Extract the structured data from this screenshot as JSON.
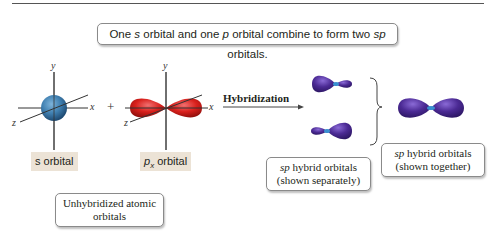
{
  "headline": {
    "prefix": "One ",
    "s": "s",
    "mid1": " orbital and one ",
    "p": "p",
    "mid2": " orbital combine to form two ",
    "sp": "sp",
    "suffix": " orbitals."
  },
  "axes": {
    "y": "y",
    "x": "x",
    "z": "z"
  },
  "operator_plus": "+",
  "arrow_label": "Hybridization",
  "labels": {
    "s_orbital": "s orbital",
    "px_p": "p",
    "px_sub": "x",
    "px_rest": " orbital"
  },
  "captions": {
    "unhybridized_line1": "Unhybridized atomic",
    "unhybridized_line2": "orbitals",
    "separate_sp": "sp",
    "separate_line1": " hybrid orbitals",
    "separate_line2": "(shown separately)",
    "together_sp": "sp",
    "together_line1": " hybrid orbitals",
    "together_line2": "(shown together)"
  },
  "colors": {
    "s_orbital": "#3f7fb0",
    "p_orbital": "#d9201c",
    "sp_orbital": "#4b2a94",
    "label_bg": "#ece3d6"
  }
}
